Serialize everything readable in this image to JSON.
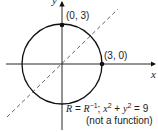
{
  "figure": {
    "x_axis_label": "x",
    "y_axis_label": "y",
    "points": [
      {
        "label": "(0, 3)",
        "x": 0,
        "y": 3
      },
      {
        "label": "(3, 0)",
        "x": 3,
        "y": 0
      }
    ],
    "circle": {
      "equation": "x² + y² = 9",
      "radius": 3
    },
    "symmetry_line": "y = x (dashed)",
    "caption_line1": "R = R⁻¹; x² + y² = 9",
    "caption_line2": "(not a function)"
  }
}
